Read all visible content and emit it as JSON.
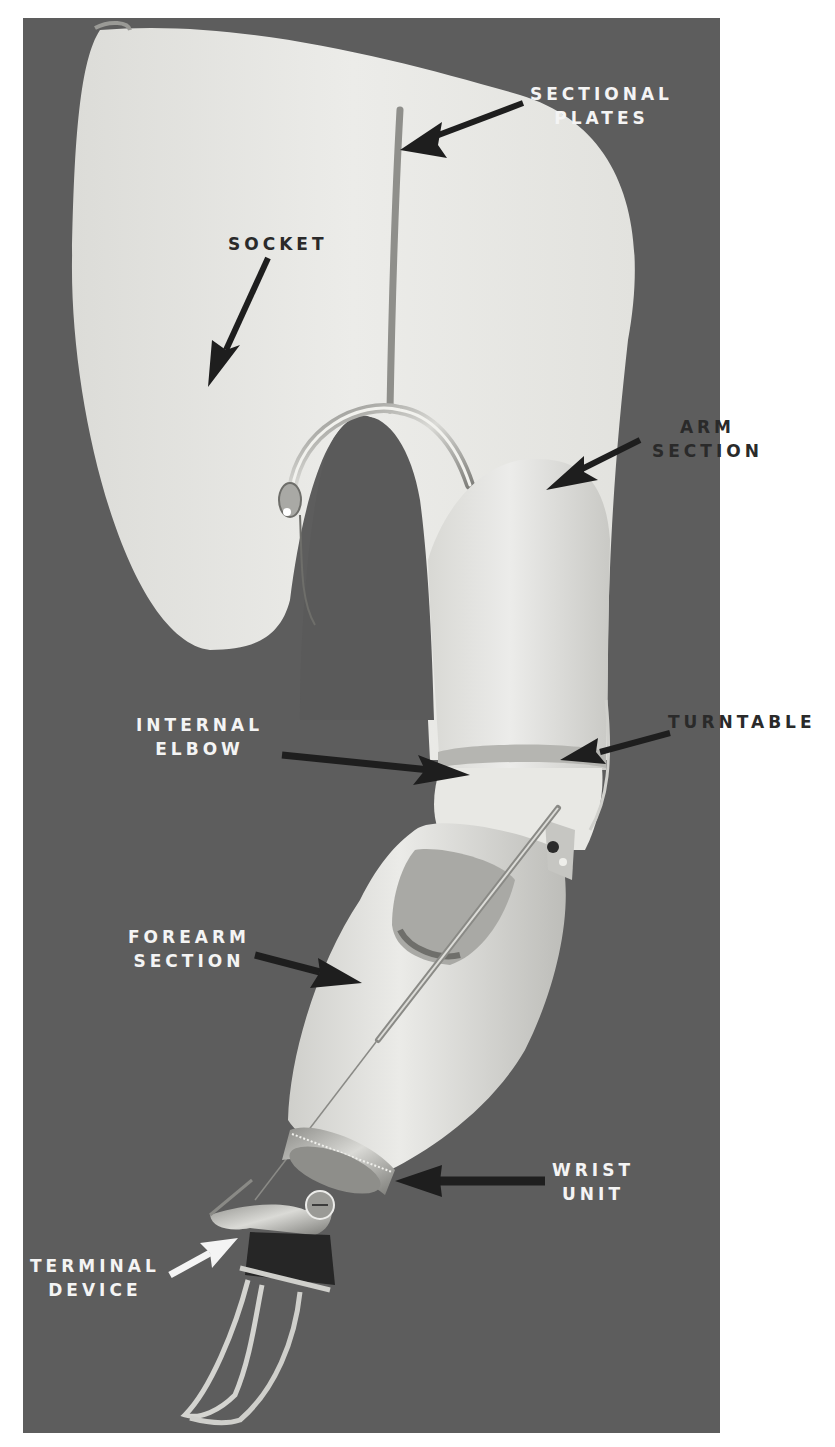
{
  "figure": {
    "colors": {
      "background_photo": "#5d5d5d",
      "page_margin": "#ffffff",
      "prosthesis_body": "#e6e6e2",
      "metal": "#b9b9b4",
      "arrow_dark": "#1e1e1e",
      "arrow_light": "#f4f4f4",
      "label_on_dark": "#f4f4f4",
      "label_on_light": "#2a2a2a"
    }
  },
  "labels": {
    "sectional_plates": {
      "line1": "SECTIONAL",
      "line2": "PLATES"
    },
    "socket": {
      "line1": "SOCKET"
    },
    "arm_section": {
      "line1": "ARM",
      "line2": "SECTION"
    },
    "internal_elbow": {
      "line1": "INTERNAL",
      "line2": "ELBOW"
    },
    "turntable": {
      "line1": "TURNTABLE"
    },
    "forearm_section": {
      "line1": "FOREARM",
      "line2": "SECTION"
    },
    "wrist_unit": {
      "line1": "WRIST",
      "line2": "UNIT"
    },
    "terminal_device": {
      "line1": "TERMINAL",
      "line2": "DEVICE"
    }
  }
}
